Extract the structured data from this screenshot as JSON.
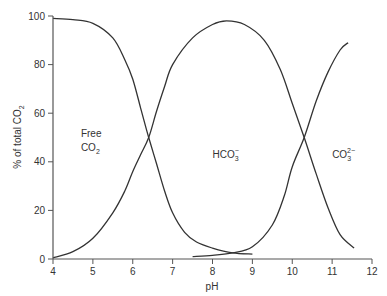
{
  "chart_data": {
    "type": "line",
    "title": "",
    "xlabel": "pH",
    "ylabel": "% of total CO2",
    "ylabel_parts": {
      "main": "% of total CO",
      "sub": "2"
    },
    "xlim": [
      4,
      12
    ],
    "ylim": [
      0,
      100
    ],
    "x_ticks": [
      4,
      5,
      6,
      7,
      8,
      9,
      10,
      11,
      12
    ],
    "y_ticks": [
      0,
      20,
      40,
      60,
      80,
      100
    ],
    "grid": false,
    "legend": null,
    "series": [
      {
        "name": "Free CO2",
        "x": [
          4.0,
          4.5,
          5.0,
          5.5,
          5.8,
          6.0,
          6.2,
          6.4,
          6.6,
          6.8,
          7.0,
          7.3,
          7.6,
          8.0,
          8.5,
          9.0
        ],
        "y": [
          99,
          98.5,
          97,
          91,
          82,
          74,
          62,
          50,
          39,
          28,
          19,
          11,
          7,
          4.5,
          2.5,
          2
        ]
      },
      {
        "name": "HCO3-",
        "x": [
          4.0,
          4.5,
          5.0,
          5.5,
          5.8,
          6.0,
          6.2,
          6.4,
          6.6,
          6.8,
          7.0,
          7.5,
          8.0,
          8.35,
          8.8,
          9.3,
          9.7,
          10.0,
          10.3,
          10.6,
          10.9,
          11.2,
          11.55
        ],
        "y": [
          0.5,
          3,
          8.5,
          19,
          28,
          36,
          43,
          50,
          61,
          71,
          80,
          91,
          96.5,
          98,
          96.5,
          90,
          78,
          64,
          50,
          35,
          21,
          10,
          4.5
        ]
      },
      {
        "name": "CO3 2-",
        "x": [
          7.5,
          8.0,
          8.5,
          9.0,
          9.5,
          9.8,
          10.0,
          10.3,
          10.6,
          10.9,
          11.2,
          11.4
        ],
        "y": [
          1,
          1.5,
          2.5,
          5,
          14,
          26,
          38,
          50,
          65,
          77,
          86,
          89
        ]
      }
    ],
    "annotations": [
      {
        "id": "free",
        "line1": "Free",
        "line2_main": "CO",
        "line2_sub": "2",
        "x": 5.0,
        "y": 52
      },
      {
        "id": "hco3",
        "main": "HCO",
        "sub": "3",
        "sup": "−",
        "x": 8.0,
        "y": 50
      },
      {
        "id": "co3",
        "main": "CO",
        "sub": "3",
        "sup": "2−",
        "x": 11.0,
        "y": 50
      }
    ],
    "colors": {
      "line": "#333333",
      "axis": "#555555",
      "text": "#333333"
    }
  }
}
